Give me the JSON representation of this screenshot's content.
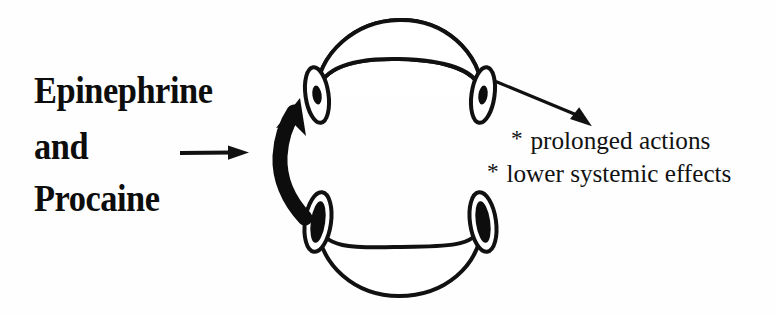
{
  "figure": {
    "title_text": "Epinephrine and Procaine vasoconstriction diagram",
    "background_color": "#fefefe",
    "ink_color": "#0d0d0d"
  },
  "drug_label": {
    "line_1": "Epinephrine",
    "line_2": "and",
    "line_3": "Procaine"
  },
  "effects": {
    "bullet_glyph": "*",
    "line_1": "prolonged actions",
    "line_2": "lower systemic effects"
  },
  "arrows": {
    "input_arrow_name": "straight right arrow after 'and'",
    "cycle_arrow_name": "thick curved counterclockwise arrow",
    "output_arrow_name": "thin diagonal arrow to effects list"
  },
  "vessel": {
    "description": "cross-sectioned blood vessel shown as two curved bands forming a broken ring",
    "upper_segment_name": "upper vessel band",
    "lower_segment_name": "lower vessel band",
    "lumen_count": 4,
    "upper_lumen_state": "constricted",
    "lower_lumen_state": "dilated"
  }
}
